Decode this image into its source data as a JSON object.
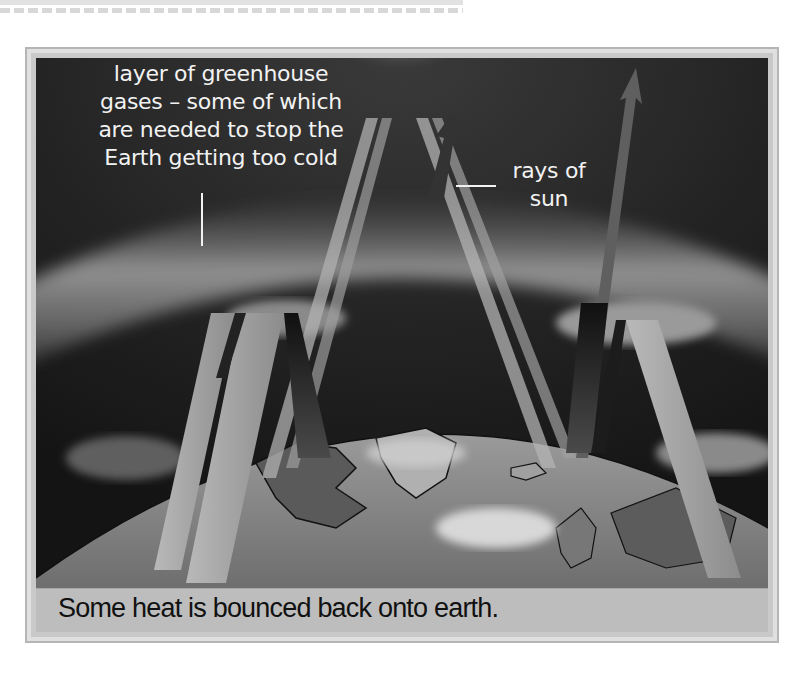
{
  "diagram": {
    "labels": {
      "greenhouse_layer": {
        "lines": [
          "layer of greenhouse",
          "gases – some of which",
          "are needed to stop the",
          "Earth getting too cold"
        ]
      },
      "rays": {
        "lines": [
          "rays of",
          "sun"
        ]
      }
    },
    "caption": "Some heat is bounced back onto earth.",
    "elements": {
      "sun": "sun-glow-icon",
      "atmosphere": "greenhouse-gas-layer",
      "earth": "earth-globe",
      "incoming_rays": 4,
      "bounced_back_arrows": 4,
      "escaping_arrows": 2
    },
    "colors": {
      "sky": "#1a1a1a",
      "atmosphere_band": "#8a8a8a",
      "ray": "#a8a8a8",
      "ray_dark": "#2a2a2a",
      "caption_bar": "#bdbdbd",
      "frame": "#c9c9c9",
      "label_text": "#f2f2f2",
      "caption_text": "#111111"
    }
  }
}
